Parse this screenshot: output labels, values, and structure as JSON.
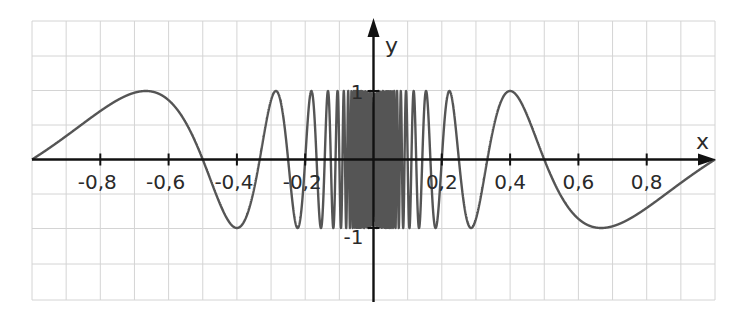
{
  "chart_data": {
    "type": "line",
    "title": "",
    "function": "y = sin(pi / x)",
    "xlabel": "x",
    "ylabel": "y",
    "xlim": [
      -1,
      1
    ],
    "ylim": [
      -2.1,
      2.0
    ],
    "x_ticks": [
      -0.8,
      -0.6,
      -0.4,
      -0.2,
      0.2,
      0.4,
      0.6,
      0.8
    ],
    "x_tick_labels": [
      "-0,8",
      "-0,6",
      "-0,4",
      "-0,2",
      "0,2",
      "0,4",
      "0,6",
      "0,8"
    ],
    "y_ticks": [
      1,
      -1
    ],
    "y_tick_labels": [
      "1",
      "-1"
    ],
    "grid": true,
    "grid_step": 0.1,
    "legend": null,
    "series": [
      {
        "name": "sin(π/x)",
        "color": "#555555",
        "key_points": [
          {
            "x": -1.0,
            "y": 0
          },
          {
            "x": -0.667,
            "y": 1
          },
          {
            "x": -0.5,
            "y": 0
          },
          {
            "x": -0.4,
            "y": -1
          },
          {
            "x": -0.333,
            "y": 0
          },
          {
            "x": -0.286,
            "y": 1
          },
          {
            "x": -0.25,
            "y": 0
          },
          {
            "x": -0.222,
            "y": -1
          },
          {
            "x": 0.222,
            "y": 1
          },
          {
            "x": 0.25,
            "y": 0
          },
          {
            "x": 0.286,
            "y": -1
          },
          {
            "x": 0.333,
            "y": 0
          },
          {
            "x": 0.4,
            "y": 1
          },
          {
            "x": 0.5,
            "y": 0
          },
          {
            "x": 0.667,
            "y": -1
          },
          {
            "x": 1.0,
            "y": 0
          }
        ]
      }
    ]
  },
  "colors": {
    "curve": "#555555",
    "axis": "#111111",
    "grid": "#d4d4d4",
    "background": "#ffffff"
  }
}
